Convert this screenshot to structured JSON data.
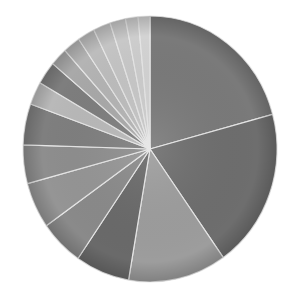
{
  "chart_data": {
    "type": "pie",
    "title": "",
    "legend": "none",
    "labels_shown": false,
    "start_angle_deg": 0,
    "direction": "clockwise",
    "categories": [
      "S1",
      "S2",
      "S3",
      "S4",
      "S5",
      "S6",
      "S7",
      "S8",
      "S9",
      "S10",
      "S11",
      "S12",
      "S13",
      "S14",
      "S15",
      "S16",
      "S17"
    ],
    "values": [
      20.8,
      19.4,
      12.5,
      6.9,
      5.6,
      5.6,
      4.7,
      5.0,
      2.8,
      2.8,
      2.2,
      2.2,
      2.2,
      2.2,
      2.0,
      1.6,
      1.5
    ],
    "colors": [
      "#7a7a7a",
      "#6e6e6e",
      "#9d9d9d",
      "#6a6a6a",
      "#8a8a8a",
      "#959595",
      "#8e8e8e",
      "#7f7f7f",
      "#b9b9b9",
      "#7e7e7e",
      "#a9a9a9",
      "#b4b4b4",
      "#bdbdbd",
      "#c4c4c4",
      "#c8c8c8",
      "#cdcdcd",
      "#d3d3d3"
    ]
  },
  "center": {
    "x": 150,
    "y": 149
  },
  "radius": {
    "rx": 127,
    "ry": 133
  }
}
